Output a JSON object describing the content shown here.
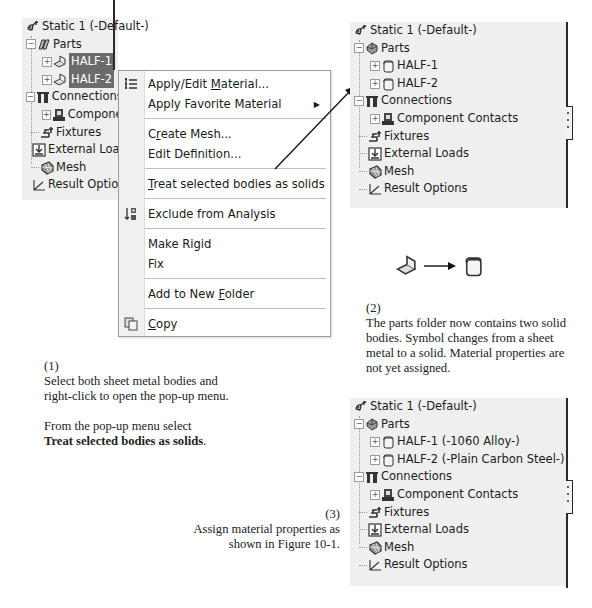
{
  "left_tree": {
    "root": "Static 1 (-Default-)",
    "parts": "Parts",
    "half1": "HALF-1",
    "half2": "HALF-2",
    "connections": "Connections",
    "component_contacts": "Componen",
    "fixtures": "Fixtures",
    "external_loads": "External Load",
    "mesh": "Mesh",
    "result_options": "Result Option"
  },
  "context_menu": {
    "items": [
      {
        "label_pre": "Apply/Edit ",
        "label_ul": "M",
        "label_post": "aterial...",
        "icon": "material-list-icon"
      },
      {
        "label_pre": "Apply Favorite Material",
        "label_ul": "",
        "label_post": "",
        "submenu": true
      },
      {
        "label_pre": "C",
        "label_ul": "r",
        "label_post": "eate Mesh..."
      },
      {
        "label_pre": "Edit Definition...",
        "label_ul": "",
        "label_post": ""
      },
      {
        "label_pre": "",
        "label_ul": "T",
        "label_post": "reat selected bodies as solids"
      },
      {
        "label_pre": "Exclude from Analysis",
        "label_ul": "",
        "label_post": "",
        "icon": "exclude-icon"
      },
      {
        "label_pre": "Make Rigid",
        "label_ul": "",
        "label_post": ""
      },
      {
        "label_pre": "Fix",
        "label_ul": "",
        "label_post": ""
      },
      {
        "label_pre": "Add to New ",
        "label_ul": "F",
        "label_post": "older"
      },
      {
        "label_pre": "",
        "label_ul": "C",
        "label_post": "opy",
        "icon": "copy-icon"
      }
    ],
    "submenu_arrow": "▶"
  },
  "right_tree_top": {
    "root": "Static 1 (-Default-)",
    "parts": "Parts",
    "half1": "HALF-1",
    "half2": "HALF-2",
    "connections": "Connections",
    "component_contacts": "Component Contacts",
    "fixtures": "Fixtures",
    "external_loads": "External Loads",
    "mesh": "Mesh",
    "result_options": "Result Options"
  },
  "right_tree_bottom": {
    "root": "Static 1 (-Default-)",
    "parts": "Parts",
    "half1": "HALF-1 (-1060 Alloy-)",
    "half2": "HALF-2 (-Plain Carbon Steel-)",
    "connections": "Connections",
    "component_contacts": "Component Contacts",
    "fixtures": "Fixtures",
    "external_loads": "External Loads",
    "mesh": "Mesh",
    "result_options": "Result Options"
  },
  "captions": {
    "step1_num": "(1)",
    "step1_line1": "Select both sheet metal bodies and",
    "step1_line2": "right-click to open the pop-up menu.",
    "step1_line3": "From the pop-up menu select",
    "step1_bold": "Treat selected bodies as solids",
    "step1_end": ".",
    "step2_num": "(2)",
    "step2_line1": "The parts folder now contains two solid",
    "step2_line2": "bodies. Symbol changes from a sheet",
    "step2_line3": "metal to a solid. Material properties are",
    "step2_line4": "not yet assigned.",
    "step3_num": "(3)",
    "step3_line1": "Assign material properties as",
    "step3_line2": "shown in Figure 10-1."
  },
  "colors": {
    "panel_bg": "#efefef",
    "selection_bg": "#6b6b6b",
    "menu_gutter": "#f0f0f0",
    "border": "#2a2a2a"
  }
}
